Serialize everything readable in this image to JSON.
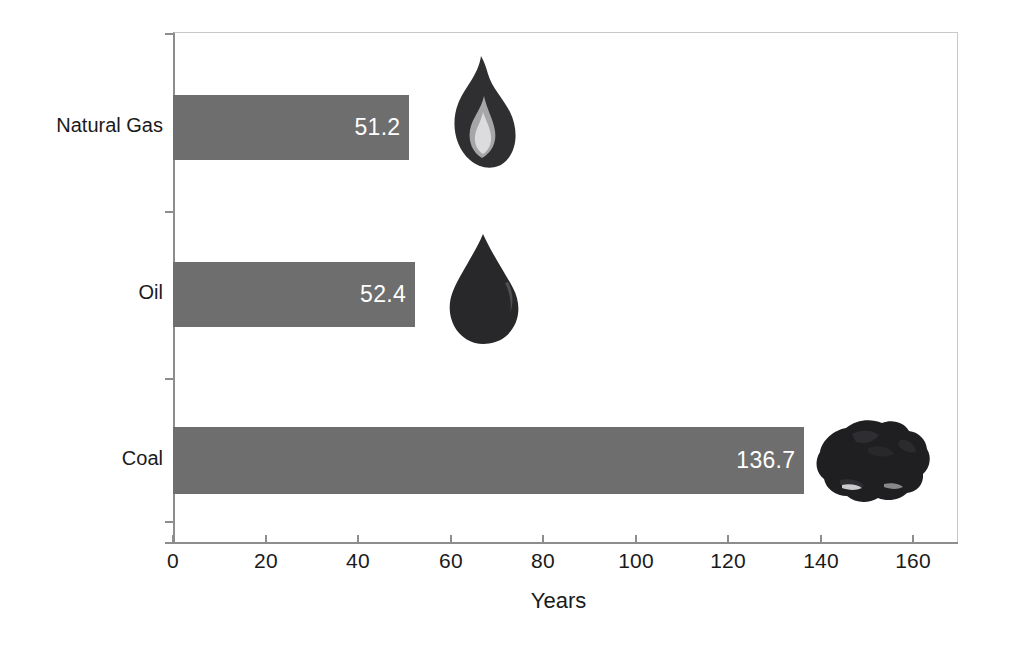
{
  "chart_data": {
    "type": "bar",
    "orientation": "horizontal",
    "title": "",
    "subtitle": "",
    "xlabel": "Years",
    "ylabel": "",
    "categories": [
      "Coal",
      "Oil",
      "Natural Gas"
    ],
    "values": [
      136.7,
      52.4,
      51.2
    ],
    "value_labels": [
      "136.7",
      "52.4",
      "51.2"
    ],
    "series": [
      {
        "name": "Reserves-to-production ratio",
        "values": [
          136.7,
          52.4,
          51.2
        ]
      }
    ],
    "xlim": [
      0,
      168
    ],
    "xticks": [
      0,
      20,
      40,
      60,
      80,
      100,
      120,
      140,
      160
    ],
    "xtick_labels": [
      "0",
      "20",
      "40",
      "60",
      "80",
      "100",
      "120",
      "140",
      "160"
    ],
    "grid": false,
    "legend": false,
    "legend_position": "none",
    "bar_color": "#6e6e6e",
    "value_label_color": "#ffffff",
    "axis_color": "#8d8d8d",
    "background_color": "#ffffff",
    "annotations": [
      {
        "name": "flame-icon",
        "for": "Natural Gas",
        "semantic": "natural-gas-flame"
      },
      {
        "name": "oil-drop-icon",
        "for": "Oil",
        "semantic": "oil-droplet"
      },
      {
        "name": "coal-lump-icon",
        "for": "Coal",
        "semantic": "coal-chunk"
      }
    ]
  },
  "axis": {
    "x_title": "Years",
    "ticks": [
      {
        "label": "0",
        "value": 0
      },
      {
        "label": "20",
        "value": 20
      },
      {
        "label": "40",
        "value": 40
      },
      {
        "label": "60",
        "value": 60
      },
      {
        "label": "80",
        "value": 80
      },
      {
        "label": "100",
        "value": 100
      },
      {
        "label": "120",
        "value": 120
      },
      {
        "label": "140",
        "value": 140
      },
      {
        "label": "160",
        "value": 160
      }
    ]
  },
  "bars": [
    {
      "category": "Natural Gas",
      "value": 51.2,
      "value_label": "51.2",
      "icon": "flame-icon"
    },
    {
      "category": "Oil",
      "value": 52.4,
      "value_label": "52.4",
      "icon": "oil-drop-icon"
    },
    {
      "category": "Coal",
      "value": 136.7,
      "value_label": "136.7",
      "icon": "coal-lump-icon"
    }
  ]
}
